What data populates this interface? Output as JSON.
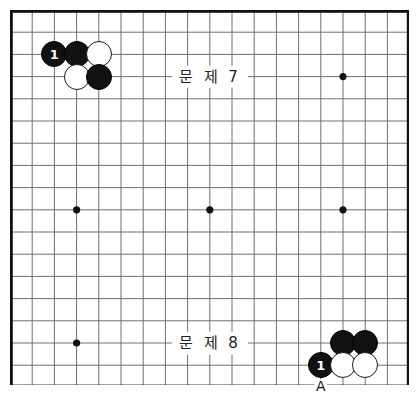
{
  "figure": {
    "board": {
      "columns": 18,
      "rows": 17,
      "spacing": 22.2,
      "origin_x": 0,
      "origin_y": 0,
      "line_color": "#6f6f6f",
      "border_color": "#111111",
      "background_color": "#ffffff"
    },
    "star_points": [
      {
        "col": 3,
        "row": 3
      },
      {
        "col": 9,
        "row": 3
      },
      {
        "col": 15,
        "row": 3
      },
      {
        "col": 3,
        "row": 9
      },
      {
        "col": 9,
        "row": 9
      },
      {
        "col": 15,
        "row": 9
      },
      {
        "col": 3,
        "row": 15
      },
      {
        "col": 9,
        "row": 15
      },
      {
        "col": 15,
        "row": 15
      }
    ],
    "stones": [
      {
        "id": "tl-black-1",
        "color": "black",
        "col": 2,
        "row": 2,
        "label": "1"
      },
      {
        "id": "tl-black-2",
        "color": "black",
        "col": 3,
        "row": 2,
        "label": ""
      },
      {
        "id": "tl-white-1",
        "color": "white",
        "col": 4,
        "row": 2,
        "label": ""
      },
      {
        "id": "tl-white-2",
        "color": "white",
        "col": 3,
        "row": 3,
        "label": ""
      },
      {
        "id": "tl-black-3",
        "color": "black",
        "col": 4,
        "row": 3,
        "label": ""
      },
      {
        "id": "br-black-1",
        "color": "black",
        "col": 15,
        "row": 15,
        "label": ""
      },
      {
        "id": "br-black-2",
        "color": "black",
        "col": 16,
        "row": 15,
        "label": ""
      },
      {
        "id": "br-black-3",
        "color": "black",
        "col": 14,
        "row": 16,
        "label": "1"
      },
      {
        "id": "br-white-1",
        "color": "white",
        "col": 15,
        "row": 16,
        "label": ""
      },
      {
        "id": "br-white-2",
        "color": "white",
        "col": 16,
        "row": 16,
        "label": ""
      }
    ],
    "point_markers": [
      {
        "id": "marker-a",
        "text": "A",
        "col": 14,
        "row": 17
      }
    ],
    "captions": [
      {
        "id": "caption-problem-7",
        "text": "문 제 7",
        "col": 9,
        "row": 3
      },
      {
        "id": "caption-problem-8",
        "text": "문 제 8",
        "col": 9,
        "row": 15
      }
    ]
  }
}
